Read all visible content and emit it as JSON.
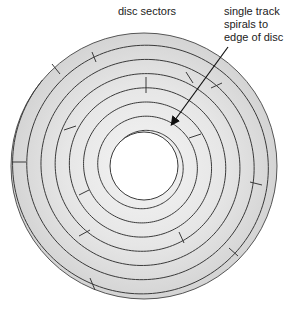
{
  "labels": {
    "sectors": "disc sectors",
    "track_lines": [
      "single track",
      "spirals to",
      "edge of disc"
    ]
  },
  "disc": {
    "center": [
      144,
      166
    ],
    "outer_radius": 133,
    "hole_radius": 34,
    "track_spacing": 14.2,
    "track_count": 7,
    "fill_color": "#e2e2e2",
    "line_color": "#3a3a3a",
    "hole_color": "#ffffff"
  },
  "arrow": {
    "from": [
      228,
      47
    ],
    "to": [
      172,
      124
    ],
    "color": "#111111"
  },
  "sector_dividers": [
    [
      [
        52,
        64
      ],
      [
        60,
        74
      ]
    ],
    [
      [
        92,
        52
      ],
      [
        96,
        62
      ]
    ],
    [
      [
        146,
        77
      ],
      [
        146,
        93
      ]
    ],
    [
      [
        186,
        72
      ],
      [
        193,
        83
      ]
    ],
    [
      [
        211,
        88
      ],
      [
        222,
        83
      ]
    ],
    [
      [
        189,
        138
      ],
      [
        201,
        134
      ]
    ],
    [
      [
        250,
        182
      ],
      [
        262,
        185
      ]
    ],
    [
      [
        12,
        162
      ],
      [
        26,
        162
      ]
    ],
    [
      [
        64,
        130
      ],
      [
        76,
        126
      ]
    ],
    [
      [
        79,
        195
      ],
      [
        89,
        190
      ]
    ],
    [
      [
        79,
        236
      ],
      [
        90,
        230
      ]
    ],
    [
      [
        90,
        278
      ],
      [
        95,
        290
      ]
    ],
    [
      [
        179,
        232
      ],
      [
        184,
        243
      ]
    ],
    [
      [
        229,
        248
      ],
      [
        238,
        256
      ]
    ]
  ]
}
